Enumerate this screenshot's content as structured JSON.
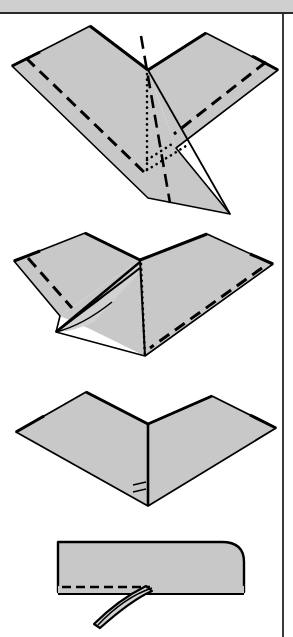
{
  "page": {
    "width": 293,
    "height": 637,
    "background_color": "#ffffff"
  },
  "header": {
    "name": "header-band",
    "fill_color": "#cfcfcf",
    "border_color": "#2a2a2a",
    "height": 14,
    "label": ""
  },
  "border": {
    "right_rule_color": "#3a3a3a",
    "right_rule_x": 282
  },
  "style": {
    "paper_fill": "#c8c8c8",
    "paper_fill_light": "#d2d2d2",
    "edge_color": "#000000",
    "fold_line_color": "#000000",
    "edge_width": 2.2,
    "crease_width": 2.6
  },
  "legend": {
    "solid_line": "cut-or-edge-line",
    "dashed_line": "valley-fold-line",
    "dotted_line": "hidden-edge-line",
    "dash_dot_line": "mountain-fold-line"
  },
  "steps": [
    {
      "index": 1,
      "name": "step-1-diagram",
      "caption": "",
      "description": "Wide flattened paper form seen from above with a central three-way vertex, dashed valley folds along both lower wing edges, a dotted hidden centre line, a dash-dot mountain fold and a long pointed tail extending to the lower right.",
      "features": [
        "center-vertex",
        "left-wing",
        "right-wing",
        "dashed-valley-fold-left",
        "dashed-valley-fold-right",
        "dotted-hidden-center-line",
        "dash-dot-mountain-fold",
        "lower-right-point"
      ]
    },
    {
      "index": 2,
      "name": "step-2-diagram",
      "caption": "",
      "description": "Same form after partially folding, with a curved free flap lifted on the lower left, dashed valley folds on both wings and a dotted vertical hidden line down the centre.",
      "features": [
        "center-vertex",
        "left-wing",
        "right-wing",
        "curved-lifted-flap",
        "dashed-valley-fold-left",
        "dashed-valley-fold-right",
        "dotted-hidden-center-line"
      ]
    },
    {
      "index": 3,
      "name": "step-3-diagram",
      "caption": "",
      "description": "Completed flat symmetrical form shaped like an arrowhead with a central vertical crease running to the bottom point and small tick marks beside it.",
      "features": [
        "center-vertex",
        "left-panel",
        "right-panel",
        "vertical-center-crease",
        "bottom-point",
        "tick-marks"
      ]
    },
    {
      "index": 4,
      "name": "step-4-diagram",
      "caption": "",
      "description": "Side view of the folded model as a rounded rectangular bar with a dashed valley fold line near its lower edge and a narrow curved strip sweeping out and down to the lower left.",
      "features": [
        "rounded-body",
        "dashed-valley-fold-line",
        "curved-strip",
        "strip-tip"
      ]
    }
  ]
}
